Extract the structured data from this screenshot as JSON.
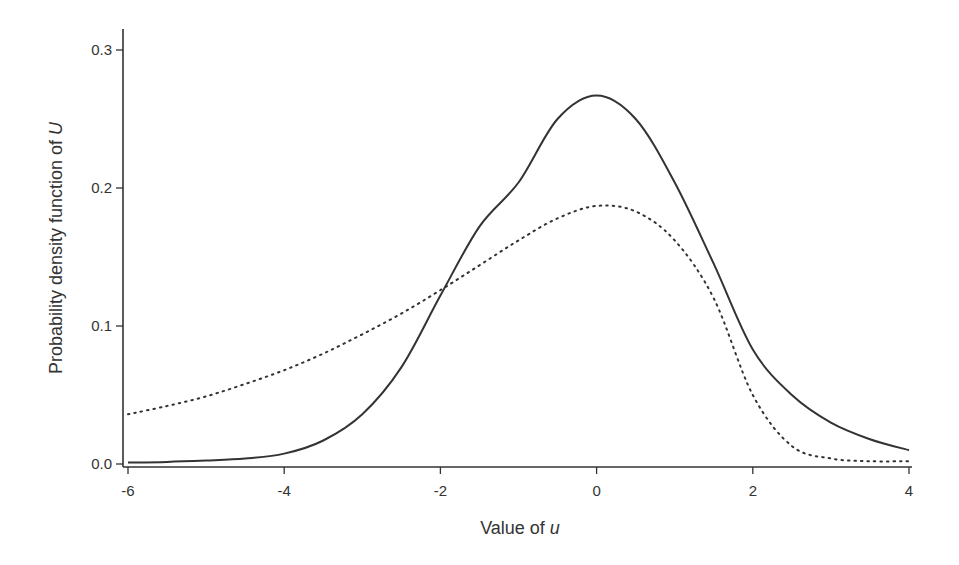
{
  "chart_data": {
    "type": "line",
    "title": "",
    "xlabel": "Value of u",
    "xlabel_parts": {
      "text": "Value of ",
      "italic": "u"
    },
    "ylabel": "Probability density function of U",
    "ylabel_parts": {
      "text": "Probability density function of ",
      "italic": "U"
    },
    "xlim": [
      -6,
      4
    ],
    "ylim": [
      0,
      0.3
    ],
    "x_ticks": [
      -6,
      -4,
      -2,
      0,
      2,
      4
    ],
    "x_tick_labels": [
      "-6",
      "-4",
      "-2",
      "0",
      "2",
      "4"
    ],
    "y_ticks": [
      0.0,
      0.1,
      0.2,
      0.3
    ],
    "y_tick_labels": [
      "0.0",
      "0.1",
      "0.2",
      "0.3"
    ],
    "grid": false,
    "legend": null,
    "series": [
      {
        "name": "solid",
        "style": "solid",
        "color": "#333333",
        "x": [
          -6,
          -5.5,
          -5,
          -4.5,
          -4,
          -3.5,
          -3,
          -2.5,
          -2,
          -1.5,
          -1,
          -0.5,
          0,
          0.5,
          1,
          1.5,
          2,
          2.5,
          3,
          3.5,
          4
        ],
        "y": [
          0.001,
          0.0015,
          0.0025,
          0.004,
          0.0075,
          0.017,
          0.036,
          0.07,
          0.122,
          0.172,
          0.204,
          0.25,
          0.267,
          0.25,
          0.204,
          0.145,
          0.083,
          0.05,
          0.03,
          0.018,
          0.01
        ]
      },
      {
        "name": "dotted",
        "style": "dotted",
        "color": "#333333",
        "x": [
          -6,
          -5.5,
          -5,
          -4.5,
          -4,
          -3.5,
          -3,
          -2.5,
          -2,
          -1.5,
          -1,
          -0.5,
          0,
          0.5,
          1,
          1.5,
          2,
          2.5,
          3,
          3.5,
          4
        ],
        "y": [
          0.036,
          0.042,
          0.049,
          0.058,
          0.068,
          0.08,
          0.094,
          0.109,
          0.126,
          0.144,
          0.162,
          0.178,
          0.187,
          0.183,
          0.162,
          0.12,
          0.05,
          0.013,
          0.004,
          0.002,
          0.002
        ]
      }
    ]
  }
}
